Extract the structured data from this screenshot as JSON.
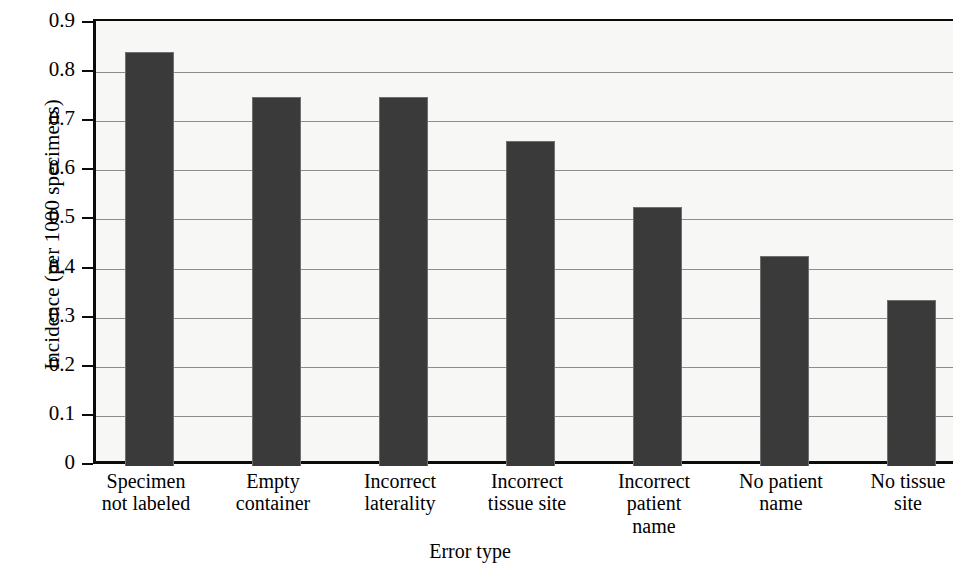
{
  "chart_data": {
    "type": "bar",
    "title": "",
    "xlabel": "Error type",
    "ylabel": "Incidence (per 1000 specimens)",
    "categories": [
      "Specimen not labeled",
      "Empty container",
      "Incorrect laterality",
      "Incorrect tissue site",
      "Incorrect patient name",
      "No patient name",
      "No tissue site"
    ],
    "category_lines": [
      [
        "Specimen",
        "not labeled"
      ],
      [
        "Empty",
        "container"
      ],
      [
        "Incorrect",
        "laterality"
      ],
      [
        "Incorrect",
        "tissue site"
      ],
      [
        "Incorrect",
        "patient",
        "name"
      ],
      [
        "No patient",
        "name"
      ],
      [
        "No tissue",
        "site"
      ]
    ],
    "values": [
      0.84,
      0.75,
      0.75,
      0.66,
      0.525,
      0.425,
      0.335
    ],
    "ylim": [
      0,
      0.9
    ],
    "yticks": [
      0,
      0.1,
      0.2,
      0.3,
      0.4,
      0.5,
      0.6,
      0.7,
      0.8,
      0.9
    ],
    "ytick_labels": [
      "0",
      "0.1",
      "0.2",
      "0.3",
      "0.4",
      "0.5",
      "0.6",
      "0.7",
      "0.8",
      "0.9"
    ],
    "grid": true,
    "legend": null,
    "bar_color": "#3a3a3a",
    "plot_background": "#f7f7f5",
    "axis_color": "#0b0b0b",
    "gridline_color": "#8d8d8d"
  }
}
